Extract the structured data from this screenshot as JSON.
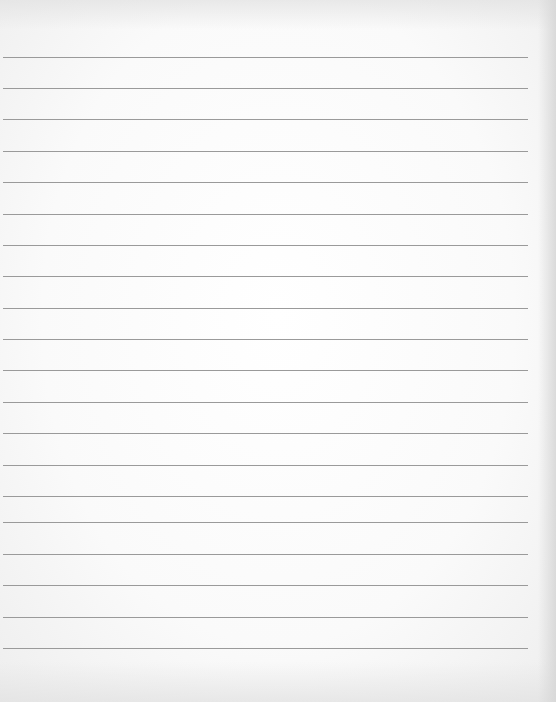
{
  "document": {
    "type": "ruled-paper",
    "line_count": 20,
    "line_color": "#9a9a9a",
    "paper_color": "#fafafa",
    "lines_y": [
      57,
      88,
      119,
      151,
      182,
      214,
      245,
      276,
      308,
      339,
      370,
      402,
      433,
      465,
      496,
      522,
      554,
      585,
      617,
      648
    ],
    "text": ""
  }
}
